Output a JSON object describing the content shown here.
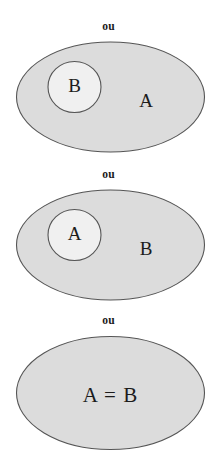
{
  "figure": {
    "background_color": "#ffffff",
    "outer_fill": "#dcdcdc",
    "inner_fill": "#f0f0f0",
    "stroke_color": "#555555",
    "text_color": "#1c1c1c"
  },
  "panels": [
    {
      "connector": "ou",
      "outer_label": "A",
      "inner_label": "B",
      "has_inner": true
    },
    {
      "connector": "ou",
      "outer_label": "B",
      "inner_label": "A",
      "has_inner": true
    },
    {
      "connector": "ou",
      "outer_label": "A = B",
      "inner_label": "",
      "has_inner": false
    }
  ]
}
